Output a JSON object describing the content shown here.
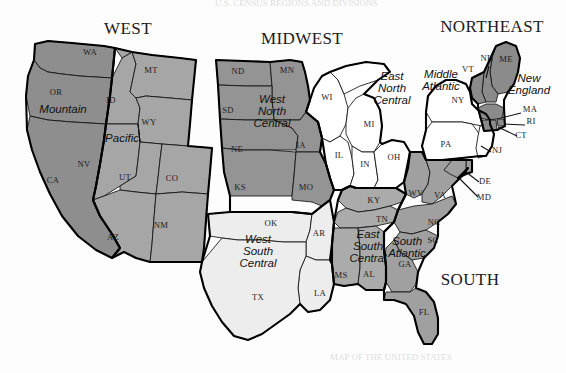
{
  "figure": {
    "background_color": "#fdfdfd",
    "ink_color": "#111111"
  },
  "top_bleed_text": "U.S. CENSUS REGIONS AND DIVISIONS",
  "bottom_bleed_text": "MAP OF THE UNITED STATES",
  "regions": [
    {
      "id": "west",
      "label": "WEST",
      "x": 128,
      "y": 34
    },
    {
      "id": "midwest",
      "label": "MIDWEST",
      "x": 302,
      "y": 44
    },
    {
      "id": "northeast",
      "label": "NORTHEAST",
      "x": 492,
      "y": 32
    },
    {
      "id": "south",
      "label": "SOUTH",
      "x": 470,
      "y": 285
    }
  ],
  "divisions": [
    {
      "id": "pacific",
      "label": "Pacific",
      "lines": [
        "Pacific"
      ],
      "x": 122,
      "y": 142,
      "fill": "#8e8e8e"
    },
    {
      "id": "mountain",
      "label": "Mountain",
      "lines": [
        "Mountain"
      ],
      "x": 63,
      "y": 113,
      "fill": "#a6a6a6"
    },
    {
      "id": "west-north-central",
      "label": "West North Central",
      "lines": [
        "West",
        "North",
        "Central"
      ],
      "x": 272,
      "y": 103,
      "fill": "#949494"
    },
    {
      "id": "east-north-central",
      "label": "East North Central",
      "lines": [
        "East",
        "North",
        "Central"
      ],
      "x": 392,
      "y": 80,
      "fill": "#ffffff"
    },
    {
      "id": "middle-atlantic",
      "label": "Middle Atlantic",
      "lines": [
        "Middle",
        "Atlantic"
      ],
      "x": 441,
      "y": 78,
      "fill": "#ffffff"
    },
    {
      "id": "new-england",
      "label": "New England",
      "lines": [
        "New",
        "England"
      ],
      "x": 529,
      "y": 82,
      "fill": "#8b8b8b"
    },
    {
      "id": "west-south-central",
      "label": "West South Central",
      "lines": [
        "West",
        "South",
        "Central"
      ],
      "x": 258,
      "y": 243,
      "fill": "#ededed"
    },
    {
      "id": "east-south-central",
      "label": "East South Central",
      "lines": [
        "East",
        "South",
        "Central"
      ],
      "x": 368,
      "y": 238,
      "fill": "#ababab"
    },
    {
      "id": "south-atlantic",
      "label": "South Atlantic",
      "lines": [
        "South",
        "Atlantic"
      ],
      "x": 407,
      "y": 245,
      "fill": "#a0a0a0"
    }
  ],
  "states": [
    {
      "abbr": "WA",
      "x": 90,
      "y": 55,
      "division": "pacific"
    },
    {
      "abbr": "OR",
      "x": 56,
      "y": 95,
      "division": "pacific"
    },
    {
      "abbr": "CA",
      "x": 53,
      "y": 183,
      "division": "pacific"
    },
    {
      "abbr": "ID",
      "x": 111,
      "y": 103,
      "division": "mountain"
    },
    {
      "abbr": "MT",
      "x": 151,
      "y": 73,
      "division": "mountain"
    },
    {
      "abbr": "WY",
      "x": 149,
      "y": 125,
      "division": "mountain"
    },
    {
      "abbr": "NV",
      "x": 84,
      "y": 167,
      "division": "mountain"
    },
    {
      "abbr": "UT",
      "x": 125,
      "y": 180,
      "division": "mountain"
    },
    {
      "abbr": "CO",
      "x": 172,
      "y": 181,
      "division": "mountain"
    },
    {
      "abbr": "AZ",
      "x": 113,
      "y": 240,
      "division": "mountain"
    },
    {
      "abbr": "NM",
      "x": 161,
      "y": 228,
      "division": "mountain"
    },
    {
      "abbr": "ND",
      "x": 238,
      "y": 74,
      "division": "west-north-central"
    },
    {
      "abbr": "MN",
      "x": 287,
      "y": 73,
      "division": "west-north-central"
    },
    {
      "abbr": "SD",
      "x": 228,
      "y": 113,
      "division": "west-north-central"
    },
    {
      "abbr": "NE",
      "x": 237,
      "y": 152,
      "division": "west-north-central"
    },
    {
      "abbr": "IA",
      "x": 301,
      "y": 148,
      "division": "west-north-central"
    },
    {
      "abbr": "KS",
      "x": 240,
      "y": 190,
      "division": "west-north-central"
    },
    {
      "abbr": "MO",
      "x": 306,
      "y": 190,
      "division": "west-north-central"
    },
    {
      "abbr": "WI",
      "x": 327,
      "y": 100,
      "division": "east-north-central"
    },
    {
      "abbr": "MI",
      "x": 369,
      "y": 127,
      "division": "east-north-central"
    },
    {
      "abbr": "IL",
      "x": 339,
      "y": 158,
      "division": "east-north-central"
    },
    {
      "abbr": "IN",
      "x": 365,
      "y": 167,
      "division": "east-north-central"
    },
    {
      "abbr": "OH",
      "x": 394,
      "y": 160,
      "division": "east-north-central"
    },
    {
      "abbr": "NY",
      "x": 458,
      "y": 103,
      "division": "middle-atlantic"
    },
    {
      "abbr": "PA",
      "x": 446,
      "y": 147,
      "division": "middle-atlantic"
    },
    {
      "abbr": "NJ",
      "x": 497,
      "y": 153,
      "division": "middle-atlantic"
    },
    {
      "abbr": "VT",
      "x": 468,
      "y": 72,
      "division": "new-england"
    },
    {
      "abbr": "NH",
      "x": 487,
      "y": 61,
      "division": "new-england"
    },
    {
      "abbr": "ME",
      "x": 506,
      "y": 62,
      "division": "new-england"
    },
    {
      "abbr": "MA",
      "x": 530,
      "y": 112,
      "division": "new-england"
    },
    {
      "abbr": "RI",
      "x": 531,
      "y": 124,
      "division": "new-england"
    },
    {
      "abbr": "CT",
      "x": 521,
      "y": 138,
      "division": "new-england"
    },
    {
      "abbr": "DE",
      "x": 485,
      "y": 184,
      "division": "south-atlantic"
    },
    {
      "abbr": "MD",
      "x": 484,
      "y": 200,
      "division": "south-atlantic"
    },
    {
      "abbr": "WV",
      "x": 416,
      "y": 196,
      "division": "south-atlantic"
    },
    {
      "abbr": "VA",
      "x": 440,
      "y": 198,
      "division": "south-atlantic"
    },
    {
      "abbr": "NC",
      "x": 434,
      "y": 225,
      "division": "south-atlantic"
    },
    {
      "abbr": "SC",
      "x": 433,
      "y": 243,
      "division": "south-atlantic"
    },
    {
      "abbr": "GA",
      "x": 405,
      "y": 267,
      "division": "south-atlantic"
    },
    {
      "abbr": "FL",
      "x": 424,
      "y": 315,
      "division": "south-atlantic"
    },
    {
      "abbr": "KY",
      "x": 374,
      "y": 203,
      "division": "east-south-central"
    },
    {
      "abbr": "TN",
      "x": 382,
      "y": 222,
      "division": "east-south-central"
    },
    {
      "abbr": "MS",
      "x": 341,
      "y": 278,
      "division": "east-south-central"
    },
    {
      "abbr": "AL",
      "x": 369,
      "y": 277,
      "division": "east-south-central"
    },
    {
      "abbr": "OK",
      "x": 271,
      "y": 226,
      "division": "west-south-central"
    },
    {
      "abbr": "AR",
      "x": 319,
      "y": 236,
      "division": "west-south-central"
    },
    {
      "abbr": "TX",
      "x": 258,
      "y": 300,
      "division": "west-south-central"
    },
    {
      "abbr": "LA",
      "x": 320,
      "y": 296,
      "division": "west-south-central"
    }
  ],
  "callouts": [
    {
      "id": "ma",
      "abbr": "MA",
      "line": "M 521,113 L 501,118"
    },
    {
      "id": "ri",
      "abbr": "RI",
      "line": "M 525,125 L 504,124"
    },
    {
      "id": "ct",
      "abbr": "CT",
      "line": "M 517,136 L 498,126"
    },
    {
      "id": "nj",
      "abbr": "NJ",
      "line": "M 491,152 L 479,146"
    },
    {
      "id": "de",
      "abbr": "DE",
      "line": "M 479,182 L 464,175"
    },
    {
      "id": "md",
      "abbr": "MD",
      "line": "M 478,197 L 461,180"
    },
    {
      "id": "nh",
      "abbr": "NH",
      "line": "M 490,66 L 492,76"
    }
  ],
  "legend_note": "Census divisions shaded by region"
}
